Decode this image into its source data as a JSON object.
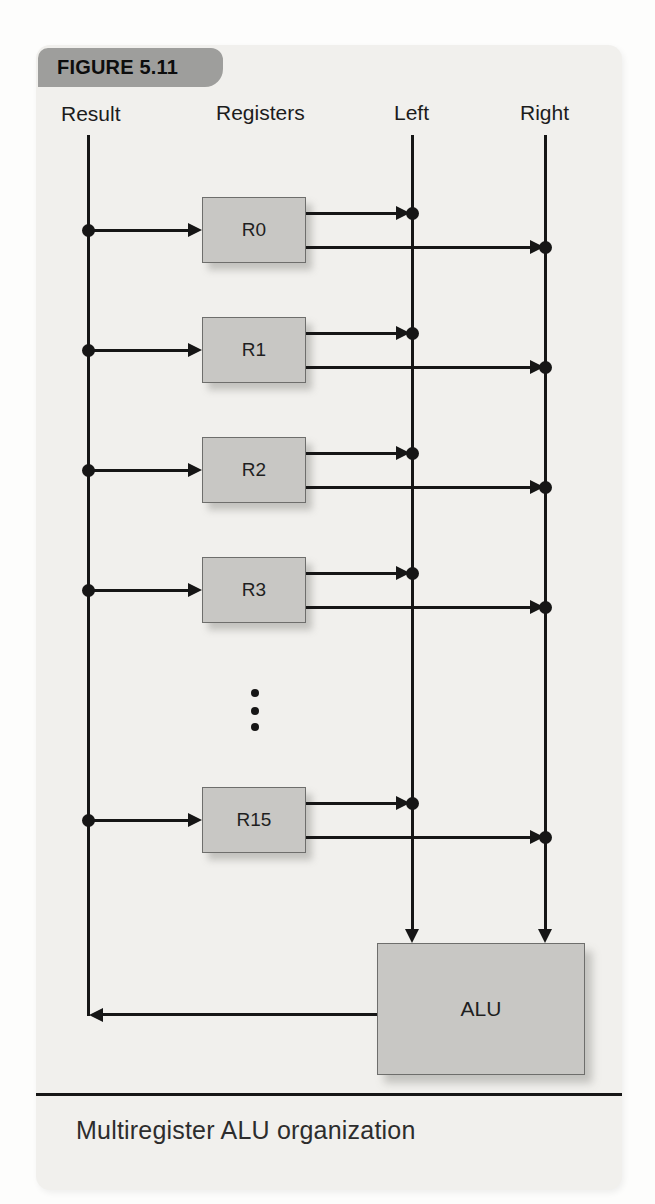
{
  "figure": {
    "badge": "FIGURE 5.11",
    "caption": "Multiregister ALU organization"
  },
  "columns": {
    "result": "Result",
    "registers": "Registers",
    "left": "Left",
    "right": "Right"
  },
  "registers": [
    "R0",
    "R1",
    "R2",
    "R3",
    "R15"
  ],
  "alu": {
    "label": "ALU"
  },
  "colors": {
    "panel_bg": "#f1f0ed",
    "badge_bg": "#9e9e9c",
    "box_fill": "#c8c7c4",
    "box_border": "#6e6e6c",
    "line": "#161616",
    "caption_text": "#2d2d2d"
  }
}
